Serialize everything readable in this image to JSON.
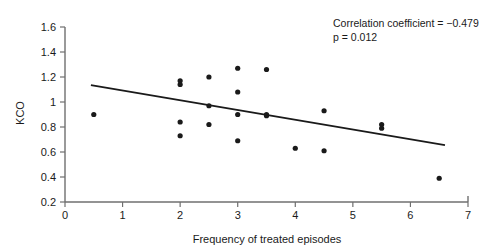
{
  "chart_data": {
    "type": "scatter",
    "title": "",
    "xlabel": "Frequency of treated episodes",
    "ylabel": "KCO",
    "xlim": [
      0,
      7
    ],
    "ylim": [
      0.2,
      1.6
    ],
    "xticks": [
      "0",
      "1",
      "2",
      "3",
      "4",
      "5",
      "6",
      "7"
    ],
    "yticks": [
      "0.2",
      "0.4",
      "0.6",
      "0.8",
      "1",
      "1.2",
      "1.4",
      "1.6"
    ],
    "grid": false,
    "legend": "none",
    "marker_color": "#1a1a1a",
    "line_color": "#1a1a1a",
    "points": [
      {
        "x": 0.5,
        "y": 0.9
      },
      {
        "x": 2.0,
        "y": 1.17
      },
      {
        "x": 2.0,
        "y": 1.14
      },
      {
        "x": 2.0,
        "y": 0.84
      },
      {
        "x": 2.0,
        "y": 0.73
      },
      {
        "x": 2.5,
        "y": 1.2
      },
      {
        "x": 2.5,
        "y": 0.97
      },
      {
        "x": 2.5,
        "y": 0.82
      },
      {
        "x": 3.0,
        "y": 1.27
      },
      {
        "x": 3.0,
        "y": 1.08
      },
      {
        "x": 3.0,
        "y": 0.9
      },
      {
        "x": 3.0,
        "y": 0.69
      },
      {
        "x": 3.5,
        "y": 1.26
      },
      {
        "x": 3.5,
        "y": 0.9
      },
      {
        "x": 3.5,
        "y": 0.89
      },
      {
        "x": 4.0,
        "y": 0.63
      },
      {
        "x": 4.5,
        "y": 0.93
      },
      {
        "x": 4.5,
        "y": 0.61
      },
      {
        "x": 5.5,
        "y": 0.82
      },
      {
        "x": 5.5,
        "y": 0.79
      },
      {
        "x": 6.5,
        "y": 0.39
      }
    ],
    "trend_line": {
      "x_start": 0.45,
      "y_start": 1.135,
      "x_end": 6.6,
      "y_end": 0.655
    },
    "annotations": [
      {
        "text": "Correlation coefficient = −0.479"
      },
      {
        "text": "p = 0.012"
      }
    ]
  }
}
